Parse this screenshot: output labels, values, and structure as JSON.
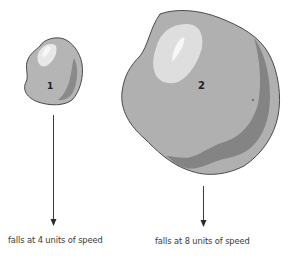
{
  "diagram": {
    "objects": [
      {
        "id": 1,
        "label": "1",
        "caption": "falls at 4 units of speed",
        "speed": 4
      },
      {
        "id": 2,
        "label": "2",
        "caption": "falls at 8 units of speed",
        "speed": 8
      }
    ],
    "colors": {
      "body": "#b3b3b3",
      "highlight": "#e6e6e6",
      "shadow": "#8a8a8a",
      "outline": "#4a4a4a",
      "arrow": "#3a3a3a"
    }
  }
}
